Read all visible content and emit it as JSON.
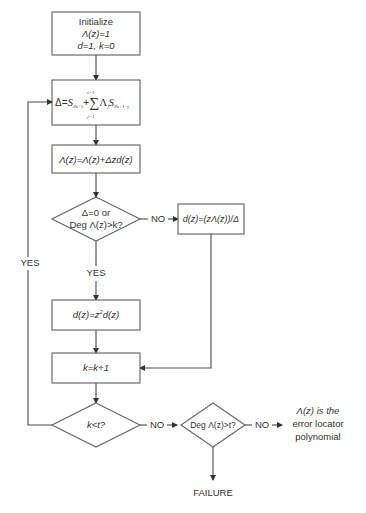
{
  "diagram": {
    "type": "flowchart",
    "nodes": {
      "init": {
        "line1": "Initialize",
        "line2": "Λ(z)=1",
        "line3": "d=1, k=0"
      },
      "delta": {
        "lhs": "Δ",
        "eq": "=",
        "s1": "S",
        "s1_sub": "2k+1",
        "plus": "+",
        "sigma": "∑",
        "sigma_top": "t−1",
        "sigma_bot": "j=1",
        "lam": "Λ",
        "lam_sub": "j",
        "s2": "S",
        "s2_sub": "2k+1−j"
      },
      "update": {
        "text": "Λ(z)=Λ(z)+Δzd(z)"
      },
      "decision1": {
        "line1": "Δ=0 or",
        "line2": "Deg Λ(z)>k?"
      },
      "dz_div": {
        "text": "d(z)=(zΛ(z))/Δ"
      },
      "dz_shift": {
        "text_a": "d(z)=z",
        "sup": "2",
        "text_b": "d(z)"
      },
      "k_inc": {
        "text": "k=k+1"
      },
      "decision2": {
        "text": "k<t?"
      },
      "decision3": {
        "text": "Deg Λ(z)>t?"
      },
      "result": {
        "line1": "Λ(z) is the",
        "line2": "error locator",
        "line3": "polynomial"
      },
      "failure": {
        "text": "FAILURE"
      }
    },
    "edge_labels": {
      "d1_no": "NO",
      "d1_yes": "YES",
      "d2_yes": "YES",
      "d2_no": "NO",
      "d3_no": "NO"
    },
    "colors": {
      "stroke": "#6a6a6a",
      "text": "#333333",
      "background": "#ffffff"
    }
  }
}
